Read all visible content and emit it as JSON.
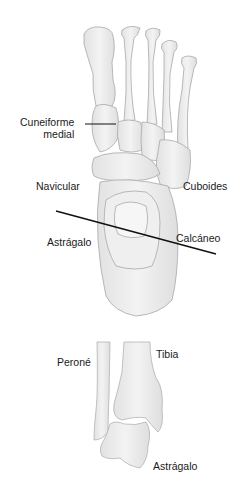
{
  "figure": {
    "top_view": {
      "labels": {
        "cuneiforme_line1": "Cuneiforme",
        "cuneiforme_line2": "medial",
        "navicular": "Navicular",
        "cuboides": "Cuboides",
        "astragalo": "Astrágalo",
        "calcaneo": "Calcáneo"
      }
    },
    "ankle_view": {
      "labels": {
        "perone": "Peroné",
        "tibia": "Tibia",
        "astragalo": "Astrágalo"
      }
    }
  },
  "colors": {
    "bone_fill": "#ececec",
    "bone_stroke": "#a8a8a8",
    "bone_shade": "#d9d9d9",
    "line": "#111111",
    "text": "#1a1a1a"
  }
}
